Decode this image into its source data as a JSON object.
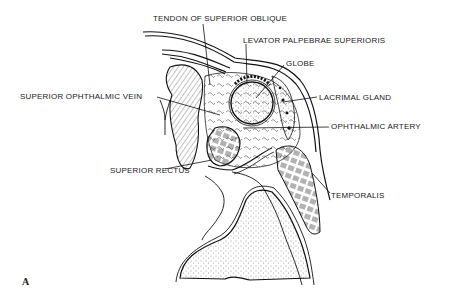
{
  "figure": {
    "panel_letter": "A",
    "labels": [
      {
        "id": "tendon-superior-oblique",
        "text": "TENDON OF SUPERIOR OBLIQUE",
        "x": 153,
        "y": 15
      },
      {
        "id": "levator-palpebrae",
        "text": "LEVATOR PALPEBRAE SUPERIORIS",
        "x": 243,
        "y": 37
      },
      {
        "id": "globe",
        "text": "GLOBE",
        "x": 286,
        "y": 60
      },
      {
        "id": "superior-ophthalmic-vein",
        "text": "SUPERIOR OPHTHALMIC VEIN",
        "x": 20,
        "y": 93
      },
      {
        "id": "lacrimal-gland",
        "text": "LACRIMAL GLAND",
        "x": 319,
        "y": 94
      },
      {
        "id": "ophthalmic-artery",
        "text": "OPHTHALMIC ARTERY",
        "x": 331,
        "y": 123
      },
      {
        "id": "superior-rectus",
        "text": "SUPERIOR RECTUS",
        "x": 110,
        "y": 167
      },
      {
        "id": "temporalis",
        "text": "TEMPORALIS",
        "x": 331,
        "y": 192
      }
    ]
  },
  "colors": {
    "ink": "#1a1a1a",
    "paper": "#ffffff"
  }
}
